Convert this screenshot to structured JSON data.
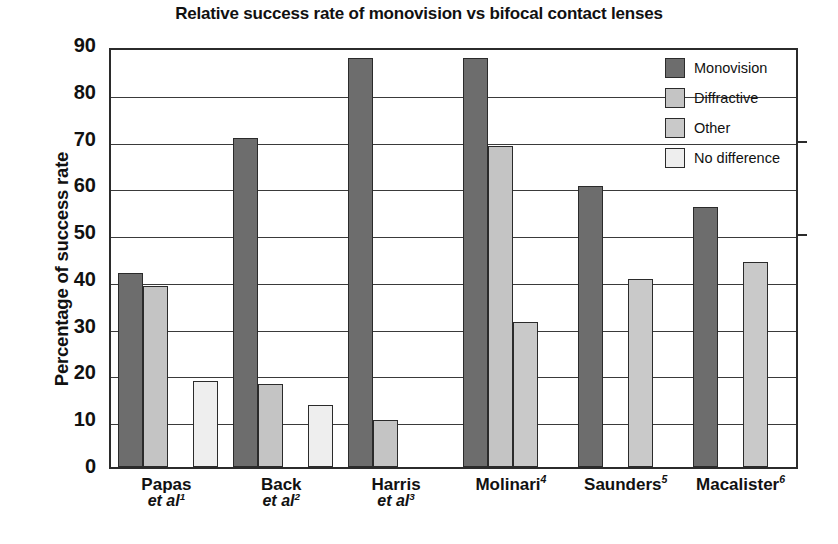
{
  "chart_data": {
    "type": "bar",
    "title": "Relative success rate of monovision vs bifocal contact lenses",
    "xlabel": "",
    "ylabel": "Percentage of success rate",
    "ylim": [
      0,
      90
    ],
    "ytick_step": 10,
    "yticks": [
      "90",
      "80",
      "70",
      "60",
      "50",
      "40",
      "30",
      "20",
      "10",
      "0"
    ],
    "grid": true,
    "legend_position": "top-right",
    "categories": [
      "Papas et al1",
      "Back et al2",
      "Harris et al3",
      "Molinari4",
      "Saunders5",
      "Macalister6"
    ],
    "series": [
      {
        "name": "Monovision",
        "color": "#6d6d6d",
        "values": [
          41.5,
          70.3,
          87.5,
          87.5,
          60.0,
          55.5
        ]
      },
      {
        "name": "Diffractive",
        "color": "#c4c4c4",
        "values": [
          38.7,
          17.7,
          10.0,
          68.7,
          null,
          null
        ]
      },
      {
        "name": "Other",
        "color": "#c9c9c9",
        "values": [
          null,
          null,
          null,
          30.9,
          40.2,
          43.8
        ]
      },
      {
        "name": "No difference",
        "color": "#eeeeee",
        "values": [
          18.4,
          13.3,
          null,
          null,
          null,
          null
        ]
      }
    ]
  },
  "legend": {
    "items": [
      {
        "label": "Monovision"
      },
      {
        "label": "Diffractive"
      },
      {
        "label": "Other"
      },
      {
        "label": "No difference"
      }
    ]
  },
  "x_labels": [
    {
      "name": "Papas",
      "etal": "et al",
      "sup": "1",
      "sup_inline": false
    },
    {
      "name": "Back",
      "etal": "et al",
      "sup": "2",
      "sup_inline": false
    },
    {
      "name": "Harris",
      "etal": "et al",
      "sup": "3",
      "sup_inline": false
    },
    {
      "name": "Molinari",
      "etal": "",
      "sup": "4",
      "sup_inline": true
    },
    {
      "name": "Saunders",
      "etal": "",
      "sup": "5",
      "sup_inline": true
    },
    {
      "name": "Macalister",
      "etal": "",
      "sup": "6",
      "sup_inline": true
    }
  ]
}
